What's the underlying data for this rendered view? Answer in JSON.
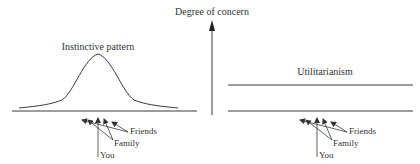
{
  "diagram": {
    "y_axis_label": "Degree of concern",
    "left_panel": {
      "title": "Instinctive pattern",
      "shape": "bell-curve",
      "arrow_labels": {
        "friends": "Friends",
        "family": "Family",
        "you": "You"
      }
    },
    "right_panel": {
      "title": "Utilitarianism",
      "shape": "flat-line",
      "arrow_labels": {
        "friends": "Friends",
        "family": "Family",
        "you": "You"
      }
    },
    "colors": {
      "line": "#3a3a3a",
      "text": "#333333",
      "background": "#ffffff"
    }
  }
}
